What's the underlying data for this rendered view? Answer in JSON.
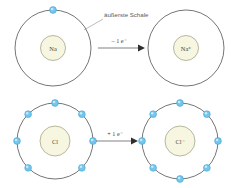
{
  "diagram": {
    "background_color": "#ffffff",
    "colors": {
      "electron_fill": "#74c6ec",
      "electron_stroke": "#3f9fd0",
      "nucleus_fill": "#f7f6e0",
      "nucleus_stroke": "#8a8a6a",
      "shell_stroke": "#3a3a3a",
      "arrow_color": "#2f2f2f",
      "callout_text_color": "#5a5a5a"
    },
    "annotation": {
      "label": "äußerste Schale"
    },
    "rows": [
      {
        "id": "sodium-row",
        "reaction_label": "– 1 e⁻",
        "before": {
          "id": "sodium-atom",
          "nucleus_label": "Na",
          "shell_electron_count": 1,
          "electron_angles_deg": [
            270
          ]
        },
        "after": {
          "id": "sodium-ion",
          "nucleus_label": "Na⁺",
          "shell_electron_count": 0,
          "electron_angles_deg": []
        }
      },
      {
        "id": "chlorine-row",
        "reaction_label": "+ 1 e⁻",
        "before": {
          "id": "chlorine-atom",
          "nucleus_label": "Cl",
          "shell_electron_count": 7,
          "electron_angles_deg": [
            270,
            315,
            0,
            45,
            135,
            180,
            225
          ]
        },
        "after": {
          "id": "chloride-ion",
          "nucleus_label": "Cl⁻",
          "shell_electron_count": 8,
          "electron_angles_deg": [
            270,
            315,
            0,
            45,
            90,
            135,
            180,
            225
          ]
        }
      }
    ]
  }
}
